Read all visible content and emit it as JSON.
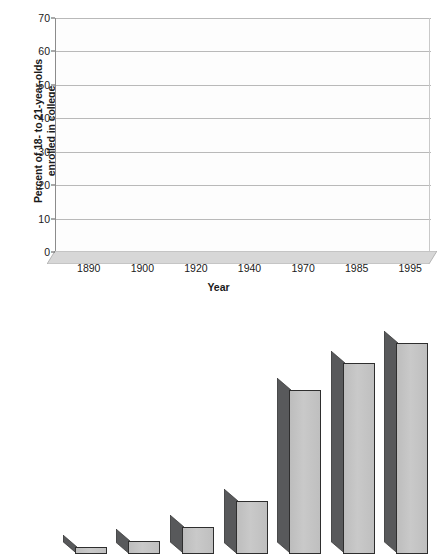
{
  "chart_data": {
    "type": "bar",
    "title": "",
    "subtitle": "",
    "xlabel": "Year",
    "ylabel": "Percent of 18- to 21-year-olds enrolled in college",
    "ylabel_lines": [
      "Percent of 18- to 21-year-olds",
      "enrolled in college"
    ],
    "categories": [
      "1890",
      "1900",
      "1920",
      "1940",
      "1970",
      "1985",
      "1995"
    ],
    "values": [
      2,
      4,
      8,
      16,
      49,
      57,
      63
    ],
    "series": [
      {
        "name": "Percent enrolled in college",
        "values": [
          2,
          4,
          8,
          16,
          49,
          57,
          63
        ]
      }
    ],
    "ylim": [
      0,
      70
    ],
    "xlim_note": "categorical",
    "yticks": [
      0,
      10,
      20,
      30,
      40,
      50,
      60,
      70
    ],
    "ytick_labels": [
      "0",
      "10",
      "20",
      "30",
      "40",
      "50",
      "60",
      "70"
    ],
    "grid": true,
    "grid_axis": "y",
    "legend": false,
    "legend_position": "none",
    "style": "3d-bar",
    "colors": {
      "bar_front": "#c4c4c4",
      "bar_side": "#58595b",
      "bar_outline": "#2e2e2e",
      "gridline": "#b9b9b9",
      "axis": "#8c8c8c",
      "text": "#1a1a1a",
      "plot_background": "#fdfdfd",
      "floor": "#d4d4d4",
      "page_background": "#ffffff"
    }
  }
}
